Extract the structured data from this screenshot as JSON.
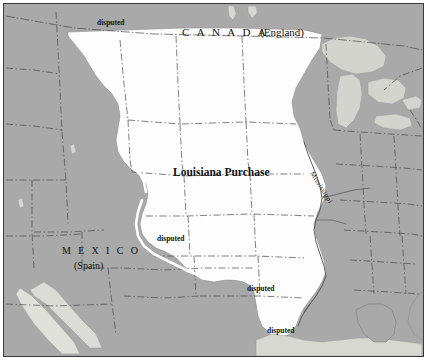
{
  "map": {
    "title": "Louisiana Purchase",
    "colors": {
      "background": "#ffffff",
      "frame": "#3a3a3a",
      "land": "#a9a9a9",
      "territory": "#fdfdfd",
      "water": "#d2d2cd",
      "boundary": "#4a4a4a",
      "disputed_line": "#ffffff",
      "river": "#555555",
      "text": "#111111"
    },
    "labels": {
      "canada": "C A N A D A",
      "canada_power": "(England)",
      "territory_title": "Louisiana Purchase",
      "mexico": "M E X I C O",
      "mexico_power": "(Spain)",
      "river_mississippi": "Mississippi",
      "disputed": "disputed"
    },
    "disputed_markers": [
      {
        "id": "disputed-north",
        "text": "disputed",
        "x": 96,
        "y": 17
      },
      {
        "id": "disputed-west",
        "text": "disputed",
        "x": 156,
        "y": 233
      },
      {
        "id": "disputed-southeast",
        "text": "disputed",
        "x": 246,
        "y": 283
      },
      {
        "id": "disputed-gulf",
        "text": "disputed",
        "x": 266,
        "y": 325
      }
    ],
    "legend_regions": [
      {
        "name": "Louisiana Purchase",
        "fill": "territory"
      },
      {
        "name": "Canada (England)",
        "fill": "land"
      },
      {
        "name": "Mexico (Spain)",
        "fill": "land"
      },
      {
        "name": "Great Lakes",
        "fill": "water"
      }
    ]
  }
}
